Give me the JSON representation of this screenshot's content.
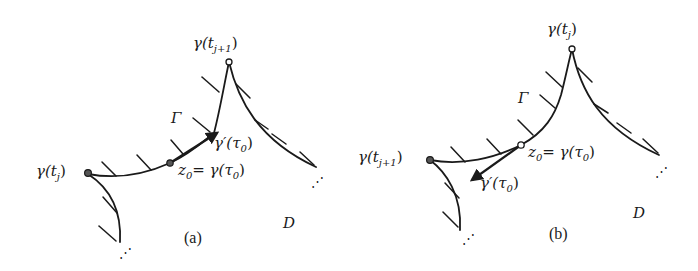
{
  "figure": {
    "panels": [
      {
        "id": "a",
        "caption": "(a)",
        "labels": {
          "start_point": "γ(t",
          "start_sub": "j",
          "peak_point": "γ(t",
          "peak_sub": "j+1",
          "curve_name": "Γ",
          "tangent": "γ′(τ",
          "tangent_sub": "0",
          "z0_prefix": "z",
          "z0_sub": "0",
          "z0_eq": "= γ(τ",
          "z0_eq_sub": "0",
          "domain": "D",
          "ellipsis": "⋰"
        },
        "tangent_direction": "toward peak"
      },
      {
        "id": "b",
        "caption": "(b)",
        "labels": {
          "start_point": "γ(t",
          "start_sub": "j+1",
          "peak_point": "γ(t",
          "peak_sub": "j",
          "curve_name": "Γ",
          "tangent": "γ′(τ",
          "tangent_sub": "0",
          "z0_prefix": "z",
          "z0_sub": "0",
          "z0_eq": "= γ(τ",
          "z0_eq_sub": "0",
          "domain": "D",
          "ellipsis": "⋰"
        },
        "tangent_direction": "away from peak"
      }
    ],
    "colors": {
      "ink": "#1a1a1a",
      "background": "#ffffff"
    }
  }
}
